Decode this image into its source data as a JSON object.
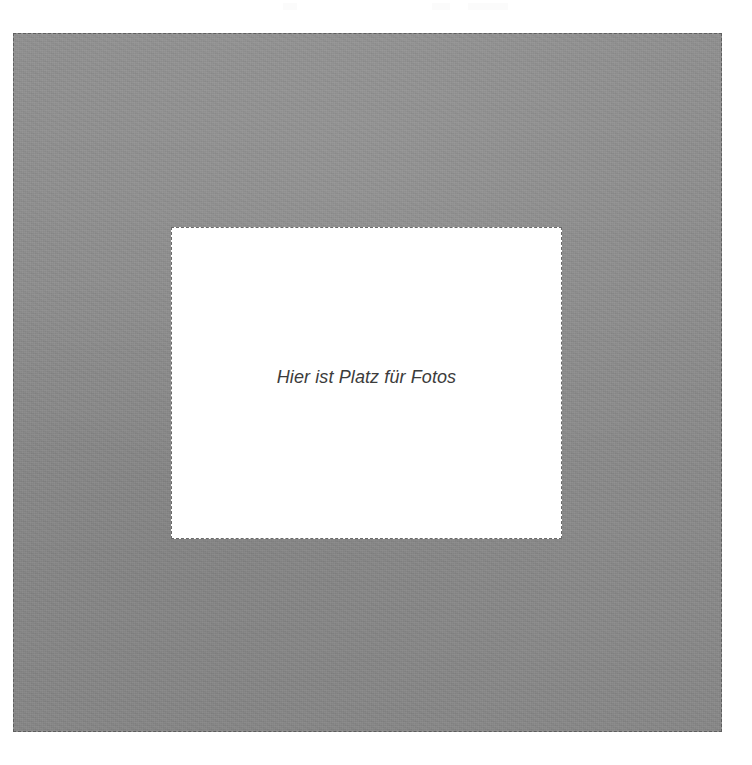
{
  "page": {
    "background_color": "#ffffff",
    "width": 752,
    "height": 765
  },
  "photo_mat": {
    "name": "photo-mat",
    "fill_color": "#8b8b8b",
    "border_style": "dashed",
    "border_color": "#5f5f5f",
    "x": 13,
    "y": 33,
    "width": 709,
    "height": 699
  },
  "photo_window": {
    "name": "photo-placeholder-window",
    "fill_color": "#ffffff",
    "border_style": "dashed",
    "border_color": "#6a6a6a",
    "x": 170,
    "y": 226,
    "width": 391,
    "height": 312,
    "placeholder_text": "Hier ist Platz für Fotos",
    "text_color": "#3c3c3c",
    "text_style": "italic"
  },
  "scan_artifacts": {
    "present": true,
    "description": "faint near-white marks along top edge"
  }
}
